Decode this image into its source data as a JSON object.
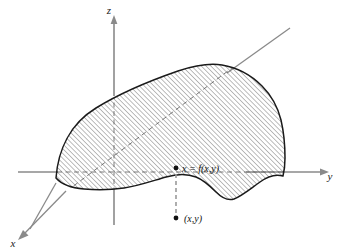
{
  "figure": {
    "background_color": "#ffffff",
    "width": 346,
    "height": 251
  },
  "axes": {
    "z": {
      "label": "z",
      "label_x": 109,
      "label_y": 14,
      "color": "#8a8a8a",
      "orientation": "vertical",
      "arrow": "up"
    },
    "y": {
      "label": "y",
      "label_x": 330,
      "label_y": 176,
      "color": "#8a8a8a",
      "orientation": "horizontal-right",
      "arrow": "right"
    },
    "x": {
      "label": "x",
      "label_x": 13,
      "label_y": 243,
      "color": "#8a8a8a",
      "orientation": "diagonal-down-left",
      "arrow": "down-left"
    }
  },
  "annotations": [
    {
      "name": "surface-point-label",
      "text": "x = f(x,y)",
      "x": 182,
      "y": 172,
      "dot_x": 176,
      "dot_y": 168,
      "color": "#111111"
    },
    {
      "name": "domain-point-label",
      "text": "(x,y)",
      "x": 184,
      "y": 222,
      "dot_x": 176,
      "dot_y": 218,
      "color": "#111111"
    }
  ],
  "surface": {
    "name": "hatched-surface",
    "outline_color": "#1a1a1a",
    "hatch_color": "#4d4d4d",
    "hatch_angle_deg": 45,
    "hatch_spacing_px": 3.4,
    "fill": "#ffffff"
  },
  "colors": {
    "ink": "#1a1a1a",
    "axis_gray": "#8a8a8a",
    "hatch": "#4d4d4d",
    "dash_gray": "#9a9a9a",
    "background": "#ffffff"
  },
  "connector": {
    "name": "vertical-drop-line",
    "style": "dashed",
    "color": "#9a9a9a",
    "from_x": 176,
    "from_y": 172,
    "to_x": 176,
    "to_y": 214
  }
}
